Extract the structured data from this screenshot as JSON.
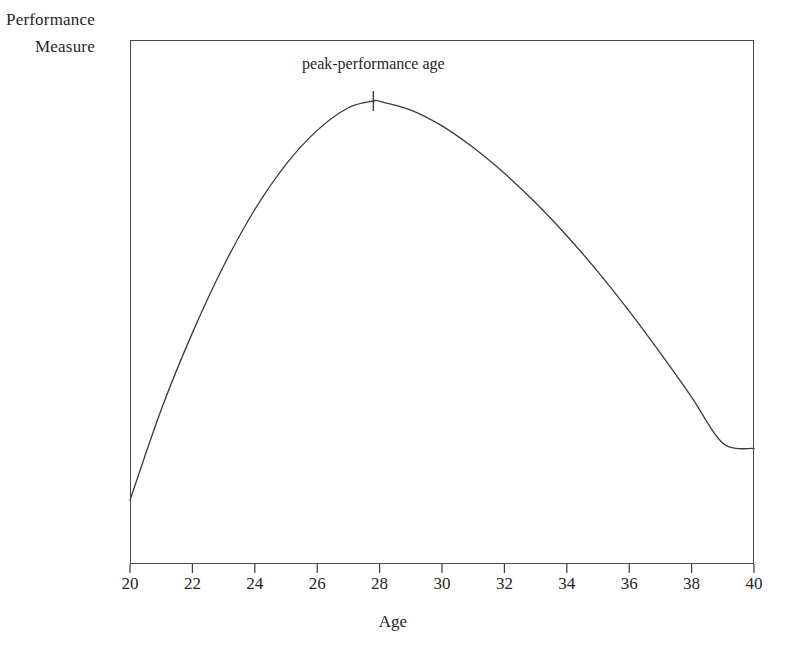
{
  "figure": {
    "background_color": "#ffffff",
    "line_color": "#3a3a3a",
    "text_color": "#262626"
  },
  "labels": {
    "ylabel_line1": "Performance",
    "ylabel_line2": "Measure",
    "xlabel": "Age",
    "annotation": "peak-performance age"
  },
  "chart_data": {
    "type": "line",
    "title": "",
    "subtitle": "",
    "xlabel": "Age",
    "ylabel": "Performance Measure",
    "xlim": [
      20,
      40
    ],
    "ylim": [
      0,
      1
    ],
    "grid": false,
    "legend": null,
    "xticks": [
      20,
      22,
      24,
      26,
      28,
      30,
      32,
      34,
      36,
      38,
      40
    ],
    "xtick_labels": [
      "20",
      "22",
      "24",
      "26",
      "28",
      "30",
      "32",
      "34",
      "36",
      "38",
      "40"
    ],
    "yticks": [],
    "ytick_labels": [],
    "annotations": [
      {
        "text": "peak-performance age",
        "x": 27.8,
        "y": 1.0,
        "marker": "vertical-tick"
      }
    ],
    "series": [
      {
        "name": "performance",
        "x": [
          20,
          21,
          22,
          23,
          24,
          25,
          26,
          27,
          27.8,
          28,
          29,
          30,
          31,
          32,
          33,
          34,
          35,
          36,
          37,
          38,
          39,
          40
        ],
        "y": [
          0.117,
          0.317,
          0.487,
          0.635,
          0.76,
          0.86,
          0.935,
          0.985,
          1.0,
          0.999,
          0.98,
          0.945,
          0.897,
          0.84,
          0.775,
          0.702,
          0.622,
          0.535,
          0.442,
          0.345,
          0.243,
          0.231
        ]
      }
    ]
  }
}
